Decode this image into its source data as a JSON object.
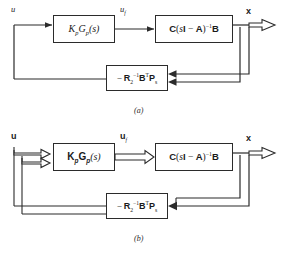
{
  "figure": {
    "background_color": "#ffffff",
    "line_color": "#2b2b2b",
    "diagrams": [
      {
        "id": "a",
        "caption": "(a)",
        "style": "single-line-solid-arrows",
        "input_label": "u",
        "intermediate_label": "u",
        "intermediate_label_sub": "f",
        "output_label": "x",
        "blocks": {
          "controller": {
            "name": "controller-block",
            "text": "KpGp(s)",
            "parts": {
              "K": "K",
              "K_sub": "p",
              "G": "G",
              "G_sub": "p",
              "arg": "(s)"
            }
          },
          "plant": {
            "name": "plant-block",
            "text": "C(sI - A)^-1 B",
            "parts": {
              "C": "C",
              "s": "s",
              "I": "I",
              "minus": "−",
              "A": "A",
              "exp": "−1",
              "B": "B"
            }
          },
          "feedback": {
            "name": "feedback-gain-block",
            "text": "-R2^-1 B^T Ps",
            "parts": {
              "minus": "−",
              "R": "R",
              "R_sub": "2",
              "exp": "−1",
              "B": "B",
              "T": "T",
              "P": "P",
              "P_sub": "s"
            }
          }
        }
      },
      {
        "id": "b",
        "caption": "(b)",
        "style": "double-line-hollow-arrows",
        "input_label": "u",
        "intermediate_label": "u",
        "intermediate_label_sub": "f",
        "output_label": "x",
        "blocks": {
          "controller": {
            "name": "controller-block",
            "text": "KpGp(s)",
            "parts": {
              "K": "K",
              "K_sub": "p",
              "G": "G",
              "G_sub": "p",
              "arg": "(s)"
            }
          },
          "plant": {
            "name": "plant-block",
            "text": "C(sI - A)^-1 B",
            "parts": {
              "C": "C",
              "s": "s",
              "I": "I",
              "minus": "−",
              "A": "A",
              "exp": "−1",
              "B": "B"
            }
          },
          "feedback": {
            "name": "feedback-gain-block",
            "text": "-R2^-1 B^T Ps",
            "parts": {
              "minus": "−",
              "R": "R",
              "R_sub": "2",
              "exp": "−1",
              "B": "B",
              "T": "T",
              "P": "P",
              "P_sub": "s"
            }
          }
        }
      }
    ]
  }
}
